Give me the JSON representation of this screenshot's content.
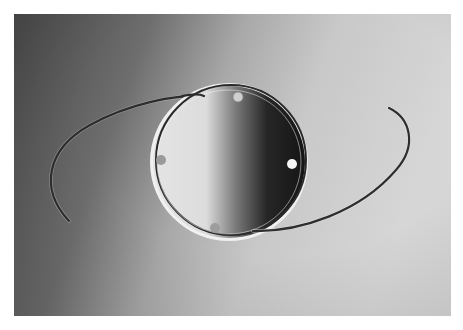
{
  "image": {
    "subject": "intraocular lens with two curved haptic loops",
    "colors": {
      "background_dark": "#4a4a4a",
      "background_mid": "#9a9a9a",
      "background_light": "#d2d2d2",
      "optic_light": "#e6e6e6",
      "optic_dark": "#1a1a1a",
      "haptic": "#2e2e2e",
      "rim": "#f2f2f2"
    },
    "optic": {
      "cx": 229,
      "cy": 162,
      "r": 78
    },
    "positioning_holes": [
      {
        "cx": 238,
        "cy": 97
      },
      {
        "cx": 161,
        "cy": 160
      },
      {
        "cx": 292,
        "cy": 164
      },
      {
        "cx": 215,
        "cy": 228
      }
    ]
  }
}
